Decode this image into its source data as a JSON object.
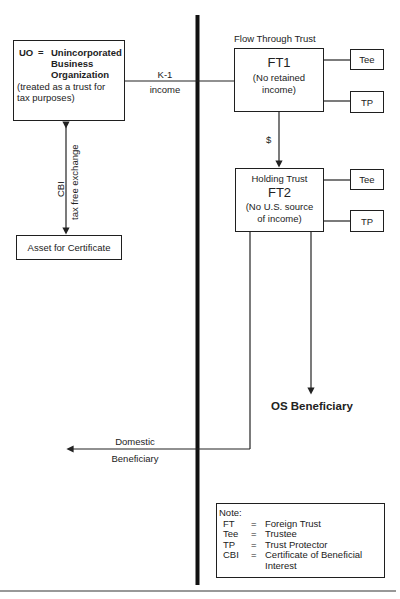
{
  "diagram": {
    "uo_box": {
      "abbr": "UO",
      "eq": "=",
      "line1": "Unincorporated",
      "line2": "Business",
      "line3": "Organization",
      "sub1": "(treated as a trust for",
      "sub2": "tax purposes)"
    },
    "k1_label": {
      "line1": "K-1",
      "line2": "income"
    },
    "cbi_label": "CBI",
    "exchange_label": "tax free exchange",
    "asset_box": "Asset for Certificate",
    "ft1": {
      "caption": "Flow Through Trust",
      "title": "FT1",
      "sub1": "(No retained",
      "sub2": "income)"
    },
    "ft1_tee": "Tee",
    "ft1_tp": "TP",
    "dollar_label": "$",
    "ft2": {
      "caption": "Holding Trust",
      "title": "FT2",
      "sub1": "(No U.S. source",
      "sub2": "of income)"
    },
    "ft2_tee": "Tee",
    "ft2_tp": "TP",
    "os_beneficiary": "OS Beneficiary",
    "domestic_beneficiary": {
      "line1": "Domestic",
      "line2": "Beneficiary"
    },
    "note": {
      "title": "Note:",
      "items": [
        {
          "abbr": "FT",
          "eq": "=",
          "def": "Foreign Trust"
        },
        {
          "abbr": "Tee",
          "eq": "=",
          "def": "Trustee"
        },
        {
          "abbr": "TP",
          "eq": "=",
          "def": "Trust Protector"
        },
        {
          "abbr": "CBI",
          "eq": "=",
          "def": "Certificate of  Beneficial Interest"
        }
      ]
    }
  }
}
